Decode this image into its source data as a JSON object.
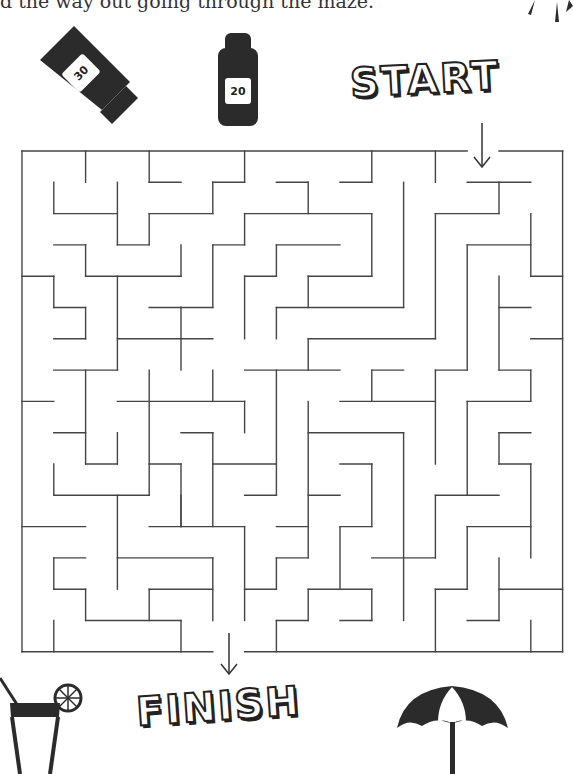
{
  "instruction": "d the way out going through the maze.",
  "labels": {
    "start": "START",
    "finish": "FINISH"
  },
  "icons": {
    "tube": {
      "name": "sunscreen-tube-icon",
      "spf": "30"
    },
    "bottle": {
      "name": "sunscreen-bottle-icon",
      "spf": "20"
    },
    "drink": {
      "name": "cocktail-icon"
    },
    "umbrella": {
      "name": "beach-umbrella-icon"
    },
    "sun": {
      "name": "sun-icon"
    }
  },
  "colors": {
    "ink": "#2b2b2b",
    "wall": "#444444",
    "background": "#ffffff"
  },
  "maze": {
    "cols": 17,
    "rows": 16,
    "origin": [
      22,
      151
    ],
    "cell": [
      31.8,
      31.3
    ],
    "entrance": {
      "side": "top",
      "col": 14
    },
    "exit": {
      "side": "bottom",
      "col": 6
    },
    "walls": [
      [
        0,
        0,
        14,
        0
      ],
      [
        15,
        0,
        17,
        0
      ],
      [
        0,
        0,
        0,
        16
      ],
      [
        17,
        0,
        17,
        16
      ],
      [
        0,
        16,
        6,
        16
      ],
      [
        7,
        16,
        17,
        16
      ],
      [
        2,
        0,
        2,
        1
      ],
      [
        4,
        0,
        4,
        1
      ],
      [
        4,
        1,
        5,
        1
      ],
      [
        7,
        0,
        7,
        1
      ],
      [
        6,
        1,
        7,
        1
      ],
      [
        11,
        0,
        11,
        1
      ],
      [
        10,
        1,
        11,
        1
      ],
      [
        13,
        0,
        13,
        1
      ],
      [
        1,
        1,
        1,
        2
      ],
      [
        1,
        2,
        3,
        2
      ],
      [
        3,
        1,
        3,
        3
      ],
      [
        3,
        3,
        4,
        3
      ],
      [
        4,
        2,
        4,
        3
      ],
      [
        4,
        2,
        6,
        2
      ],
      [
        6,
        1,
        6,
        2
      ],
      [
        8,
        1,
        9,
        1
      ],
      [
        9,
        1,
        9,
        2
      ],
      [
        7,
        2,
        11,
        2
      ],
      [
        11,
        2,
        11,
        4
      ],
      [
        12,
        1,
        12,
        5
      ],
      [
        14,
        1,
        16,
        1
      ],
      [
        15,
        1,
        15,
        2
      ],
      [
        13,
        2,
        15,
        2
      ],
      [
        13,
        2,
        13,
        6
      ],
      [
        16,
        2,
        16,
        4
      ],
      [
        14,
        3,
        16,
        3
      ],
      [
        14,
        3,
        14,
        7
      ],
      [
        16,
        4,
        17,
        4
      ],
      [
        7,
        2,
        7,
        3
      ],
      [
        6,
        3,
        7,
        3
      ],
      [
        6,
        3,
        6,
        5
      ],
      [
        5,
        5,
        6,
        5
      ],
      [
        8,
        3,
        10,
        3
      ],
      [
        8,
        3,
        8,
        4
      ],
      [
        7,
        4,
        8,
        4
      ],
      [
        7,
        4,
        7,
        6
      ],
      [
        9,
        4,
        11,
        4
      ],
      [
        9,
        4,
        9,
        5
      ],
      [
        8,
        5,
        12,
        5
      ],
      [
        1,
        3,
        2,
        3
      ],
      [
        2,
        3,
        2,
        4
      ],
      [
        2,
        4,
        5,
        4
      ],
      [
        5,
        3,
        5,
        4
      ],
      [
        0,
        4,
        1,
        4
      ],
      [
        1,
        4,
        1,
        5
      ],
      [
        1,
        5,
        2,
        5
      ],
      [
        2,
        5,
        2,
        6
      ],
      [
        1,
        6,
        2,
        6
      ],
      [
        3,
        4,
        3,
        7
      ],
      [
        1,
        7,
        3,
        7
      ],
      [
        3,
        6,
        6,
        6
      ],
      [
        4,
        5,
        5,
        5
      ],
      [
        5,
        5,
        5,
        7
      ],
      [
        8,
        5,
        8,
        6
      ],
      [
        9,
        6,
        13,
        6
      ],
      [
        9,
        6,
        9,
        7
      ],
      [
        7,
        7,
        10,
        7
      ],
      [
        8,
        7,
        8,
        11
      ],
      [
        11,
        7,
        12,
        7
      ],
      [
        11,
        7,
        11,
        8
      ],
      [
        10,
        8,
        13,
        8
      ],
      [
        15,
        4,
        15,
        7
      ],
      [
        15,
        5,
        16,
        5
      ],
      [
        15,
        7,
        16,
        7
      ],
      [
        16,
        7,
        16,
        8
      ],
      [
        14,
        8,
        16,
        8
      ],
      [
        14,
        8,
        14,
        11
      ],
      [
        16,
        6,
        17,
        6
      ],
      [
        13,
        7,
        14,
        7
      ],
      [
        13,
        7,
        13,
        10
      ],
      [
        2,
        7,
        2,
        10
      ],
      [
        0,
        8,
        1,
        8
      ],
      [
        1,
        9,
        2,
        9
      ],
      [
        3,
        9,
        3,
        10
      ],
      [
        2,
        10,
        3,
        10
      ],
      [
        4,
        7,
        4,
        11
      ],
      [
        3,
        8,
        7,
        8
      ],
      [
        6,
        7,
        6,
        8
      ],
      [
        7,
        8,
        7,
        9
      ],
      [
        5,
        9,
        6,
        9
      ],
      [
        6,
        9,
        6,
        12
      ],
      [
        6,
        10,
        8,
        10
      ],
      [
        7,
        11,
        8,
        11
      ],
      [
        4,
        10,
        5,
        10
      ],
      [
        5,
        10,
        5,
        12
      ],
      [
        9,
        8,
        9,
        13
      ],
      [
        9,
        9,
        12,
        9
      ],
      [
        12,
        9,
        12,
        15
      ],
      [
        10,
        10,
        11,
        10
      ],
      [
        11,
        10,
        11,
        12
      ],
      [
        10,
        12,
        11,
        12
      ],
      [
        10,
        12,
        10,
        14
      ],
      [
        9,
        14,
        11,
        14
      ],
      [
        9,
        11,
        10,
        11
      ],
      [
        8,
        12,
        9,
        12
      ],
      [
        8,
        13,
        9,
        13
      ],
      [
        8,
        13,
        8,
        14
      ],
      [
        7,
        14,
        8,
        14
      ],
      [
        9,
        14,
        9,
        15
      ],
      [
        8,
        15,
        9,
        15
      ],
      [
        8,
        15,
        8,
        16
      ],
      [
        11,
        14,
        11,
        15
      ],
      [
        10,
        15,
        11,
        15
      ],
      [
        11,
        13,
        13,
        13
      ],
      [
        13,
        11,
        13,
        13
      ],
      [
        13,
        11,
        15,
        11
      ],
      [
        15,
        9,
        16,
        9
      ],
      [
        15,
        9,
        15,
        10
      ],
      [
        15,
        10,
        16,
        10
      ],
      [
        16,
        10,
        16,
        13
      ],
      [
        14,
        12,
        16,
        12
      ],
      [
        14,
        12,
        14,
        14
      ],
      [
        13,
        14,
        14,
        14
      ],
      [
        13,
        14,
        13,
        16
      ],
      [
        15,
        13,
        15,
        15
      ],
      [
        14,
        15,
        15,
        15
      ],
      [
        15,
        14,
        17,
        14
      ],
      [
        16,
        15,
        16,
        16
      ],
      [
        1,
        10,
        1,
        11
      ],
      [
        1,
        11,
        4,
        11
      ],
      [
        3,
        11,
        3,
        14
      ],
      [
        0,
        12,
        2,
        12
      ],
      [
        4,
        12,
        7,
        12
      ],
      [
        5,
        11,
        5,
        12
      ],
      [
        7,
        12,
        7,
        15
      ],
      [
        3,
        13,
        6,
        13
      ],
      [
        6,
        13,
        6,
        15
      ],
      [
        1,
        13,
        2,
        13
      ],
      [
        1,
        13,
        1,
        14
      ],
      [
        1,
        14,
        2,
        14
      ],
      [
        2,
        14,
        2,
        15
      ],
      [
        2,
        15,
        5,
        15
      ],
      [
        4,
        14,
        6,
        14
      ],
      [
        4,
        14,
        4,
        15
      ],
      [
        5,
        15,
        5,
        16
      ],
      [
        1,
        15,
        1,
        16
      ]
    ]
  }
}
